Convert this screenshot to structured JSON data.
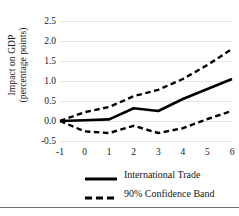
{
  "chart_data": {
    "type": "line",
    "title": "",
    "xlabel": "",
    "ylabel": "Impact on GDP (percentage points)",
    "ylabel_lines": [
      "Impact on GDP",
      "(percentage points)"
    ],
    "x": [
      -1,
      0,
      1,
      2,
      3,
      4,
      5,
      6
    ],
    "xticklabels": [
      "-1",
      "0",
      "1",
      "2",
      "3",
      "4",
      "5",
      "6"
    ],
    "yticks": [
      -0.5,
      0.0,
      0.5,
      1.0,
      1.5,
      2.0,
      2.5
    ],
    "yticklabels": [
      "-0.5",
      "0.0",
      "0.5",
      "1.0",
      "1.5",
      "2.0",
      "2.5"
    ],
    "xlim": [
      -1,
      6
    ],
    "ylim": [
      -0.5,
      2.5
    ],
    "grid": true,
    "legend_position": "bottom",
    "series": [
      {
        "name": "International Trade",
        "style": "solid",
        "color": "#000000",
        "values": [
          0.0,
          0.02,
          0.04,
          0.32,
          0.25,
          0.55,
          0.8,
          1.05
        ]
      },
      {
        "name": "90% Confidence Band Upper",
        "style": "dashed",
        "color": "#000000",
        "values": [
          0.0,
          0.22,
          0.35,
          0.62,
          0.78,
          1.05,
          1.4,
          1.8
        ]
      },
      {
        "name": "90% Confidence Band Lower",
        "style": "dashed",
        "color": "#000000",
        "values": [
          0.0,
          -0.26,
          -0.3,
          -0.12,
          -0.3,
          -0.18,
          0.05,
          0.25
        ]
      }
    ],
    "legend": [
      {
        "label": "International Trade",
        "style": "solid"
      },
      {
        "label": "90% Confidence Band",
        "style": "dashed"
      }
    ]
  }
}
